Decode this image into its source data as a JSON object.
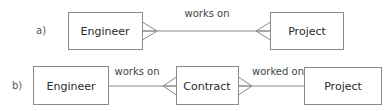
{
  "diagram": {
    "type": "entity-relationship",
    "notation": "crow's foot",
    "colors": {
      "stroke": "#8a8a8a",
      "text": "#2a2a2a",
      "background": "#ffffff"
    },
    "rows": [
      {
        "label": "a)",
        "entities": [
          {
            "name": "Engineer"
          },
          {
            "name": "Project"
          }
        ],
        "relationships": [
          {
            "label": "works on",
            "from": "Engineer",
            "to": "Project",
            "from_cardinality": "many",
            "to_cardinality": "many"
          }
        ]
      },
      {
        "label": "b)",
        "entities": [
          {
            "name": "Engineer"
          },
          {
            "name": "Contract"
          },
          {
            "name": "Project"
          }
        ],
        "relationships": [
          {
            "label": "works on",
            "from": "Engineer",
            "to": "Contract",
            "from_cardinality": "one",
            "to_cardinality": "many"
          },
          {
            "label": "worked on",
            "from": "Contract",
            "to": "Project",
            "from_cardinality": "many",
            "to_cardinality": "one"
          }
        ]
      }
    ]
  }
}
